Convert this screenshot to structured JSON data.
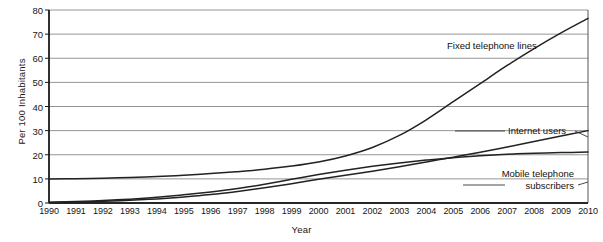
{
  "chart_data": {
    "type": "line",
    "title": "",
    "xlabel": "Year",
    "ylabel": "Per 100 Inhabitants",
    "xlim": [
      1990,
      2010
    ],
    "ylim": [
      0,
      80
    ],
    "ytick_step": 10,
    "grid": "horizontal",
    "legend_position": "inline-annotations",
    "x": [
      1990,
      1991,
      1992,
      1993,
      1994,
      1995,
      1996,
      1997,
      1998,
      1999,
      2000,
      2001,
      2002,
      2003,
      2004,
      2005,
      2006,
      2007,
      2008,
      2009,
      2010
    ],
    "xticklabels": [
      "1990",
      "1991",
      "1992",
      "1993",
      "1994",
      "1995",
      "1996",
      "1997",
      "1998",
      "1999",
      "2000",
      "2001",
      "2002",
      "2003",
      "2004",
      "2005",
      "2006",
      "2007",
      "2008",
      "2009",
      "2010"
    ],
    "yticklabels": [
      "0",
      "10",
      "20",
      "30",
      "40",
      "50",
      "60",
      "70",
      "80"
    ],
    "series": [
      {
        "name": "Fixed telephone lines",
        "color": "#222222",
        "values": [
          10.0,
          10.1,
          10.3,
          10.6,
          11.0,
          11.5,
          12.2,
          13.0,
          14.0,
          15.3,
          17.0,
          19.5,
          23.0,
          28.0,
          34.5,
          42.0,
          49.5,
          57.0,
          64.0,
          70.5,
          76.5
        ]
      },
      {
        "name": "Internet users",
        "color": "#222222",
        "values": [
          0.2,
          0.4,
          0.7,
          1.1,
          1.7,
          2.5,
          3.5,
          4.8,
          6.3,
          8.0,
          9.8,
          11.5,
          13.2,
          15.0,
          17.0,
          19.0,
          21.0,
          23.2,
          25.5,
          27.8,
          30.0
        ]
      },
      {
        "name": "Mobile telephone subscribers",
        "color": "#222222",
        "values": [
          0.3,
          0.6,
          1.0,
          1.6,
          2.4,
          3.4,
          4.6,
          6.0,
          7.8,
          9.8,
          11.8,
          13.6,
          15.2,
          16.6,
          17.8,
          18.8,
          19.6,
          20.2,
          20.6,
          20.9,
          21.1
        ]
      }
    ],
    "annotations": [
      {
        "text": "Fixed telephone lines",
        "series": "Fixed telephone lines"
      },
      {
        "text": "Internet users",
        "series": "Internet users"
      },
      {
        "text_line1": "Mobile telephone",
        "text_line2": "subscribers",
        "series": "Mobile telephone subscribers"
      }
    ]
  },
  "axis": {
    "ylabel": "Per 100 Inhabitants",
    "xlabel": "Year"
  }
}
